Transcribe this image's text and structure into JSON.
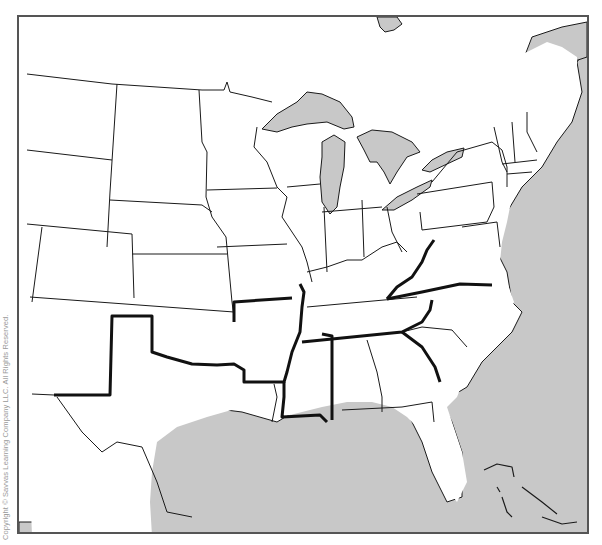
{
  "map": {
    "type": "outline-map",
    "region": "Eastern United States",
    "colors": {
      "land": "#ffffff",
      "water": "#c8c8c8",
      "state_border": "#1a1a1a",
      "highlighted_border": "#111111",
      "frame": "#555555"
    },
    "bodies_of_water": [
      "Lake Superior",
      "Lake Michigan",
      "Lake Huron",
      "Lake Erie",
      "Lake Ontario",
      "Atlantic Ocean",
      "Gulf of Mexico"
    ],
    "highlighted_borders": "Thick outline surrounding the southern states from Texas to Virginia"
  },
  "copyright": "Copyright © Savvas Learning Company LLC. All Rights Reserved."
}
